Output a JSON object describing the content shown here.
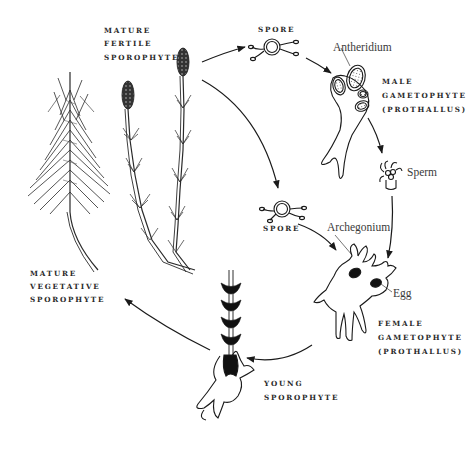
{
  "diagram": {
    "colors": {
      "ink": "#1a1a1a",
      "label": "#2a2a2a",
      "background": "#ffffff"
    },
    "labels": {
      "mature_fertile": [
        "MATURE",
        "FERTILE",
        "SPOROPHYTE"
      ],
      "spore_top": "SPORE",
      "antheridium": "Antheridium",
      "male_gametophyte": [
        "MALE",
        "GAMETOPHYTE",
        "(PROTHALLUS)"
      ],
      "sperm": "Sperm",
      "spore_mid": "SPORE",
      "archegonium": "Archegonium",
      "egg": "Egg",
      "female_gametophyte": [
        "FEMALE",
        "GAMETOPHYTE",
        "(PROTHALLUS)"
      ],
      "young_sporophyte": [
        "YOUNG",
        "SPOROPHYTE"
      ],
      "mature_vegetative": [
        "MATURE",
        "VEGETATIVE",
        "SPOROPHYTE"
      ]
    },
    "stages": [
      "mature-fertile-sporophyte",
      "spore",
      "male-gametophyte",
      "sperm",
      "female-gametophyte",
      "young-sporophyte",
      "mature-vegetative-sporophyte"
    ]
  }
}
